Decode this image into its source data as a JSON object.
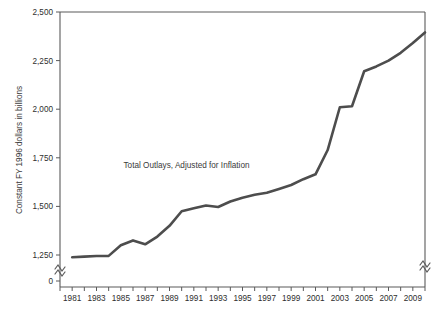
{
  "chart_data": {
    "type": "line",
    "title": "",
    "xlabel": "",
    "ylabel": "Constant FY 1996 dollars in billions",
    "annotations": [
      {
        "text": "Total Outlays, Adjusted for Inflation",
        "x": 1990.4,
        "y": 1700
      }
    ],
    "grid": false,
    "legend": "none",
    "axis_break": {
      "present": true,
      "symbol": "zigzag",
      "between": [
        0,
        1250
      ],
      "sides": [
        "left",
        "right"
      ]
    },
    "ylim": [
      0,
      2500
    ],
    "y_ticks": [
      0,
      1250,
      1500,
      1750,
      2000,
      2250,
      2500
    ],
    "y_tick_labels": [
      "0",
      "1,250",
      "1,500",
      "1,750",
      "2,000",
      "2,250",
      "2,500"
    ],
    "xlim": [
      1980,
      2010
    ],
    "x_ticks": [
      1980,
      1981,
      1982,
      1983,
      1984,
      1985,
      1986,
      1987,
      1988,
      1989,
      1990,
      1991,
      1992,
      1993,
      1994,
      1995,
      1996,
      1997,
      1998,
      1999,
      2000,
      2001,
      2002,
      2003,
      2004,
      2005,
      2006,
      2007,
      2008,
      2009,
      2010
    ],
    "x_tick_labels": [
      "1981",
      "1983",
      "1985",
      "1987",
      "1989",
      "1991",
      "1993",
      "1995",
      "1997",
      "1999",
      "2001",
      "2003",
      "2005",
      "2007",
      "2009"
    ],
    "x_tick_label_years": [
      1981,
      1983,
      1985,
      1987,
      1989,
      1991,
      1993,
      1995,
      1997,
      1999,
      2001,
      2003,
      2005,
      2007,
      2009
    ],
    "series": [
      {
        "name": "Total Outlays, Adjusted for Inflation",
        "color": "#4d4d4d",
        "x": [
          1981,
          1982,
          1983,
          1984,
          1985,
          1986,
          1987,
          1988,
          1989,
          1990,
          1991,
          1992,
          1993,
          1994,
          1995,
          1996,
          1997,
          1998,
          1999,
          2000,
          2001,
          2002,
          2003,
          2004,
          2005,
          2006,
          2007,
          2008,
          2009,
          2010
        ],
        "values": [
          1140,
          1172,
          1205,
          1207,
          1300,
          1325,
          1305,
          1345,
          1400,
          1475,
          1490,
          1505,
          1497,
          1525,
          1545,
          1560,
          1570,
          1590,
          1610,
          1640,
          1665,
          1790,
          2010,
          2015,
          2195,
          2220,
          2250,
          2290,
          2340,
          2395
        ]
      }
    ]
  },
  "axis": {
    "y_axis_label": "Constant FY 1996 dollars in billions"
  }
}
